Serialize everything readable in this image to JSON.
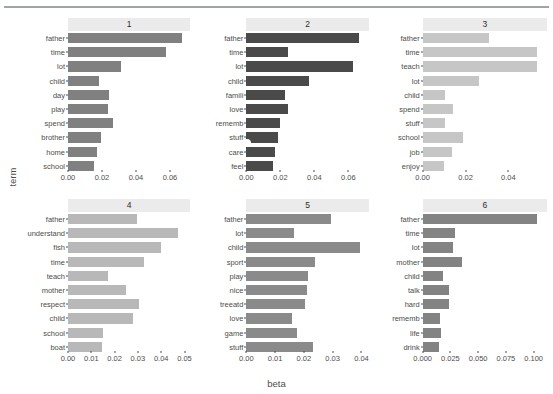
{
  "chart_data": {
    "type": "bar",
    "title": "",
    "xlabel": "beta",
    "ylabel": "term",
    "orientation": "horizontal",
    "grid": false,
    "legend": false,
    "facets": [
      {
        "label": "1",
        "color": "#808080",
        "xlim": [
          0,
          0.072
        ],
        "xticks": [
          0.0,
          0.02,
          0.04,
          0.06
        ],
        "xtick_labels": [
          "0.00",
          "0.02",
          "0.04",
          "0.06"
        ],
        "categories": [
          "father",
          "time",
          "lot",
          "child",
          "day",
          "play",
          "spend",
          "brother",
          "home",
          "school"
        ],
        "values": [
          0.067,
          0.0575,
          0.0312,
          0.0182,
          0.024,
          0.0236,
          0.0262,
          0.0196,
          0.0168,
          0.0155
        ]
      },
      {
        "label": "2",
        "color": "#4a4a4a",
        "xlim": [
          0,
          0.072
        ],
        "xticks": [
          0.0,
          0.02,
          0.04,
          0.06
        ],
        "xtick_labels": [
          "0.00",
          "0.02",
          "0.04",
          "0.06"
        ],
        "categories": [
          "father",
          "time",
          "lot",
          "child",
          "famili",
          "love",
          "rememb",
          "stuff",
          "care",
          "feel"
        ],
        "values": [
          0.0665,
          0.0243,
          0.063,
          0.0367,
          0.0228,
          0.0245,
          0.02,
          0.0184,
          0.017,
          0.0155
        ]
      },
      {
        "label": "3",
        "color": "#c6c6c6",
        "xlim": [
          0,
          0.058
        ],
        "xticks": [
          0.0,
          0.02,
          0.04
        ],
        "xtick_labels": [
          "0.00",
          "0.02",
          "0.04"
        ],
        "categories": [
          "father",
          "time",
          "teach",
          "lot",
          "child",
          "spend",
          "stuff",
          "school",
          "job",
          "enjoy"
        ],
        "values": [
          0.031,
          0.0535,
          0.0532,
          0.0262,
          0.0102,
          0.0143,
          0.0102,
          0.0188,
          0.0136,
          0.01
        ]
      },
      {
        "label": "4",
        "color": "#b8b8b8",
        "xlim": [
          0,
          0.0525
        ],
        "xticks": [
          0.0,
          0.01,
          0.02,
          0.03,
          0.04,
          0.05
        ],
        "xtick_labels": [
          "0.00",
          "0.01",
          "0.02",
          "0.03",
          "0.04",
          "0.05"
        ],
        "categories": [
          "father",
          "understand",
          "fish",
          "time",
          "teach",
          "mother",
          "respect",
          "child",
          "school",
          "boat"
        ],
        "values": [
          0.0298,
          0.0473,
          0.04,
          0.0328,
          0.0172,
          0.025,
          0.0305,
          0.0278,
          0.015,
          0.0146
        ]
      },
      {
        "label": "5",
        "color": "#8a8a8a",
        "xlim": [
          0,
          0.0425
        ],
        "xticks": [
          0.0,
          0.01,
          0.02,
          0.03,
          0.04
        ],
        "xtick_labels": [
          "0.00",
          "0.01",
          "0.02",
          "0.03",
          "0.04"
        ],
        "categories": [
          "father",
          "lot",
          "child",
          "sport",
          "play",
          "nice",
          "treeatd",
          "love",
          "game",
          "stuff"
        ],
        "values": [
          0.0295,
          0.0165,
          0.0395,
          0.024,
          0.0215,
          0.021,
          0.0203,
          0.0158,
          0.0175,
          0.0233
        ]
      },
      {
        "label": "6",
        "color": "#838383",
        "xlim": [
          0,
          0.112
        ],
        "xticks": [
          0.0,
          0.025,
          0.05,
          0.075,
          0.1
        ],
        "xtick_labels": [
          "0.000",
          "0.025",
          "0.050",
          "0.075",
          "0.100"
        ],
        "categories": [
          "father",
          "time",
          "lot",
          "mother",
          "child",
          "talk",
          "hard",
          "rememb",
          "life",
          "drink"
        ],
        "values": [
          0.103,
          0.029,
          0.0275,
          0.035,
          0.018,
          0.0237,
          0.0235,
          0.0152,
          0.0162,
          0.0143
        ]
      }
    ]
  },
  "cursor": {
    "name": "mouse-pointer",
    "x": 247,
    "y": 143
  }
}
